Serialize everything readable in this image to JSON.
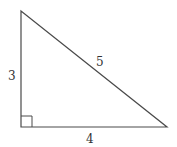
{
  "diagram": {
    "type": "right-triangle",
    "stroke_color": "#4a4a4a",
    "vertices": {
      "top": [
        21,
        11
      ],
      "right_angle": [
        21,
        127
      ],
      "right": [
        167,
        127
      ]
    },
    "right_angle_marker_size": 11,
    "labels": {
      "vertical_leg": "3",
      "horizontal_leg": "4",
      "hypotenuse": "5"
    }
  }
}
